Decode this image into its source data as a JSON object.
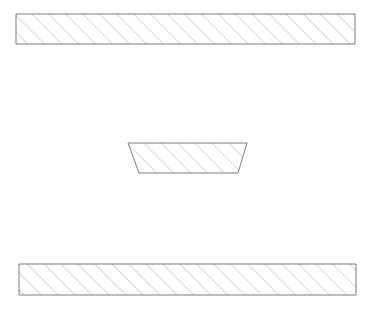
{
  "canvas": {
    "width": 373,
    "height": 317,
    "background_color": "#ffffff"
  },
  "style": {
    "outline_color": "#6e6e6e",
    "outline_width": 0.9,
    "hatch_color": "#9a9a9a",
    "hatch_width": 0.8,
    "hatch_angle_degrees": 45,
    "hatch_spacing_px": 12,
    "fill_color": "#ffffff"
  },
  "diagram": {
    "shape_count": 3
  },
  "shapes": [
    {
      "id": "upper-bar",
      "label": "Upper hatched bar",
      "type": "rectangle",
      "points": "16,14 355,14 355,44 16,44",
      "x": 16,
      "y": 14,
      "width": 339,
      "height": 30
    },
    {
      "id": "center-trapezoid",
      "label": "Central hatched trapezoid",
      "type": "trapezoid",
      "points": "128,143 247,143 238,173 139,173",
      "top_width": 119,
      "bottom_width": 99,
      "height": 30,
      "top_y": 143,
      "bottom_y": 173
    },
    {
      "id": "lower-bar",
      "label": "Lower hatched bar",
      "type": "rectangle",
      "points": "19,264 356,264 356,295 19,295",
      "x": 19,
      "y": 264,
      "width": 337,
      "height": 31
    }
  ]
}
